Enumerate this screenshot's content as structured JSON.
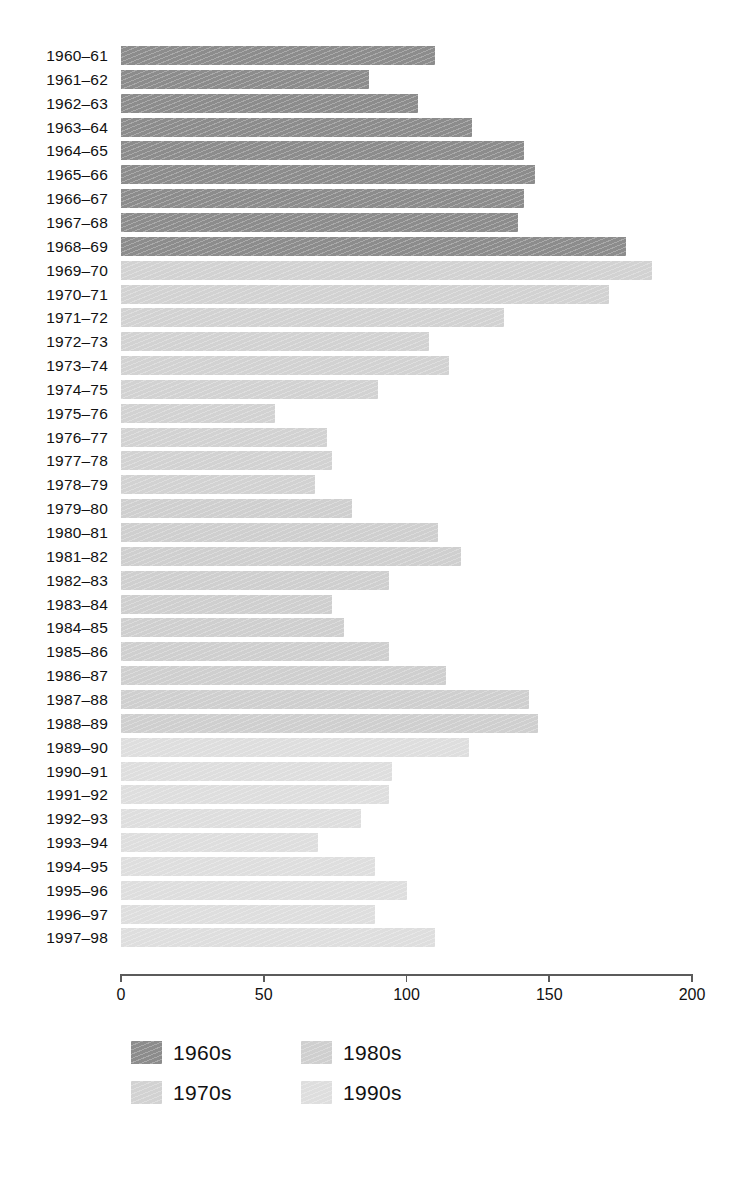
{
  "chart_data": {
    "type": "bar",
    "orientation": "horizontal",
    "title": "",
    "subtitle": "",
    "xlabel": "",
    "ylabel": "",
    "xlim": [
      0,
      200
    ],
    "xticks": [
      0,
      50,
      100,
      150,
      200
    ],
    "xtick_labels": [
      "0",
      "50",
      "100",
      "150",
      "200"
    ],
    "grid": false,
    "legend_position": "bottom-left",
    "categories": [
      "1960–61",
      "1961–62",
      "1962–63",
      "1963–64",
      "1964–65",
      "1965–66",
      "1966–67",
      "1967–68",
      "1968–69",
      "1969–70",
      "1970–71",
      "1971–72",
      "1972–73",
      "1973–74",
      "1974–75",
      "1975–76",
      "1976–77",
      "1977–78",
      "1978–79",
      "1979–80",
      "1980–81",
      "1981–82",
      "1982–83",
      "1983–84",
      "1984–85",
      "1985–86",
      "1986–87",
      "1987–88",
      "1988–89",
      "1989–90",
      "1990–91",
      "1991–92",
      "1992–93",
      "1993–94",
      "1994–95",
      "1995–96",
      "1996–97",
      "1997–98"
    ],
    "values": [
      110,
      87,
      104,
      123,
      141,
      145,
      141,
      139,
      177,
      186,
      171,
      134,
      108,
      115,
      90,
      54,
      72,
      74,
      68,
      81,
      111,
      119,
      94,
      74,
      78,
      94,
      114,
      143,
      146,
      122,
      95,
      94,
      84,
      69,
      89,
      100,
      89,
      110
    ],
    "groups": [
      "1960s",
      "1960s",
      "1960s",
      "1960s",
      "1960s",
      "1960s",
      "1960s",
      "1960s",
      "1960s",
      "1970s",
      "1970s",
      "1970s",
      "1970s",
      "1970s",
      "1970s",
      "1970s",
      "1970s",
      "1970s",
      "1970s",
      "1980s",
      "1980s",
      "1980s",
      "1980s",
      "1980s",
      "1980s",
      "1980s",
      "1980s",
      "1980s",
      "1980s",
      "1990s",
      "1990s",
      "1990s",
      "1990s",
      "1990s",
      "1990s",
      "1990s",
      "1990s",
      "1990s"
    ]
  },
  "legend": {
    "items": [
      {
        "label": "1960s",
        "color": "#8c8c8c"
      },
      {
        "label": "1970s",
        "color": "#d2d2d2"
      },
      {
        "label": "1980s",
        "color": "#cfcfcf"
      },
      {
        "label": "1990s",
        "color": "#dedede"
      }
    ]
  },
  "colors": {
    "group_1960s": "#8c8c8c",
    "group_1970s": "#d2d2d2",
    "group_1980s": "#cfcfcf",
    "group_1990s": "#dedede",
    "axis": "#5b5b5b",
    "text": "#111111",
    "background": "#ffffff"
  }
}
